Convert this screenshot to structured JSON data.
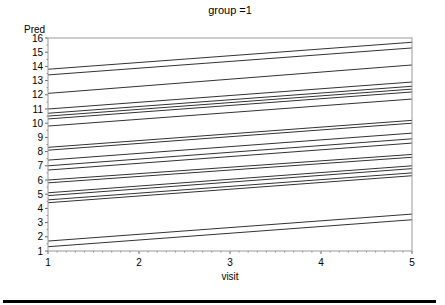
{
  "chart_data": {
    "type": "line",
    "title": "group =1",
    "xlabel": "visit",
    "ylabel": "Pred",
    "xlim": [
      1,
      5
    ],
    "ylim": [
      1,
      16
    ],
    "x_ticks": [
      1,
      2,
      3,
      4,
      5
    ],
    "y_ticks": [
      1,
      2,
      3,
      4,
      5,
      6,
      7,
      8,
      9,
      10,
      11,
      12,
      13,
      14,
      15,
      16
    ],
    "grid": false,
    "legend": null,
    "line_color": "#333333",
    "x": [
      1,
      5
    ],
    "series": [
      {
        "name": "subject 1",
        "values": [
          13.8,
          15.7
        ]
      },
      {
        "name": "subject 2",
        "values": [
          13.4,
          15.3
        ]
      },
      {
        "name": "subject 3",
        "values": [
          12.1,
          14.1
        ]
      },
      {
        "name": "subject 4",
        "values": [
          11.0,
          12.9
        ]
      },
      {
        "name": "subject 5",
        "values": [
          10.7,
          12.6
        ]
      },
      {
        "name": "subject 6",
        "values": [
          10.5,
          12.4
        ]
      },
      {
        "name": "subject 7",
        "values": [
          10.3,
          12.2
        ]
      },
      {
        "name": "subject 8",
        "values": [
          9.8,
          11.7
        ]
      },
      {
        "name": "subject 9",
        "values": [
          8.3,
          10.2
        ]
      },
      {
        "name": "subject 10",
        "values": [
          8.1,
          10.0
        ]
      },
      {
        "name": "subject 11",
        "values": [
          7.4,
          9.3
        ]
      },
      {
        "name": "subject 12",
        "values": [
          7.0,
          8.9
        ]
      },
      {
        "name": "subject 13",
        "values": [
          6.7,
          8.6
        ]
      },
      {
        "name": "subject 14",
        "values": [
          6.0,
          7.8
        ]
      },
      {
        "name": "subject 15",
        "values": [
          5.8,
          7.6
        ]
      },
      {
        "name": "subject 16",
        "values": [
          5.1,
          7.0
        ]
      },
      {
        "name": "subject 17",
        "values": [
          4.9,
          6.8
        ]
      },
      {
        "name": "subject 18",
        "values": [
          4.6,
          6.5
        ]
      },
      {
        "name": "subject 19",
        "values": [
          4.4,
          6.3
        ]
      },
      {
        "name": "subject 20",
        "values": [
          1.7,
          3.6
        ]
      },
      {
        "name": "subject 21",
        "values": [
          1.3,
          3.2
        ]
      }
    ]
  }
}
